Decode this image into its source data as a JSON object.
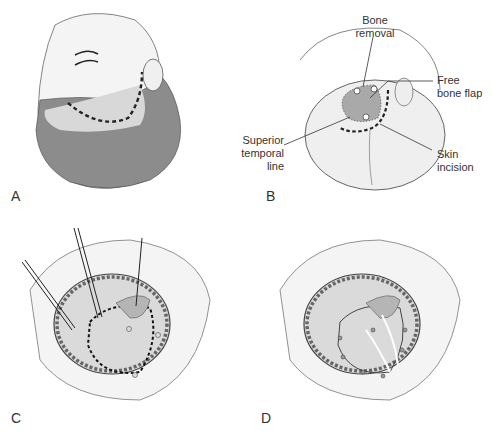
{
  "figure": {
    "panels": [
      {
        "id": "A",
        "label": "A",
        "description": "Head tilted with curved dashed skin incision line behind hairline"
      },
      {
        "id": "B",
        "label": "B",
        "description": "Skull view showing bone removal region, free bone flap, skin incision, superior temporal line"
      },
      {
        "id": "C",
        "label": "C",
        "description": "Scalp retracted with hooks; dashed outline of planned craniotomy with burr holes"
      },
      {
        "id": "D",
        "label": "D",
        "description": "Bone flap removed, sutured dural tack-up points and arrows"
      }
    ],
    "annotations": {
      "bone_removal": "Bone\nremoval",
      "bone_removal_l1": "Bone",
      "bone_removal_l2": "removal",
      "free_bone_flap_l1": "Free",
      "free_bone_flap_l2": "bone flap",
      "superior_temporal_line_l1": "Superior",
      "superior_temporal_line_l2": "temporal",
      "superior_temporal_line_l3": "line",
      "skin_incision_l1": "Skin",
      "skin_incision_l2": "incision"
    },
    "colors": {
      "skin": "#f2f2f2",
      "hair": "#8a8a8a",
      "bone_flap": "#a9a9a9",
      "outline": "#444444",
      "dashed": "#222222"
    }
  }
}
